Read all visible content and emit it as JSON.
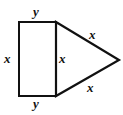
{
  "figure": {
    "kind": "geometry-diagram",
    "stroke_color": "#111111",
    "fill_color": "#ffffff",
    "background_color": "#ffffff",
    "stroke_width": 2.2,
    "labels": {
      "top_y": "y",
      "bottom_y": "y",
      "left_x": "x",
      "middle_x": "x",
      "upper_right_x": "x",
      "lower_right_x": "x"
    },
    "geometry": {
      "rectangle": {
        "top_left": [
          19,
          22
        ],
        "top_right": [
          56,
          22
        ],
        "bottom_right": [
          56,
          96
        ],
        "bottom_left": [
          19,
          96
        ],
        "width": 37,
        "height": 74
      },
      "triangle": {
        "apex": [
          119,
          60
        ],
        "top_base": [
          56,
          22
        ],
        "bottom_base": [
          56,
          96
        ]
      }
    }
  }
}
